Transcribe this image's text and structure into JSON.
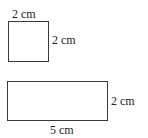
{
  "square": {
    "top_label": "2 cm",
    "side_label": "2 cm"
  },
  "rectangle": {
    "side_label": "2 cm",
    "bottom_label": "5 cm"
  },
  "colors": {
    "stroke": "#3a3a3a",
    "text": "#222222"
  }
}
